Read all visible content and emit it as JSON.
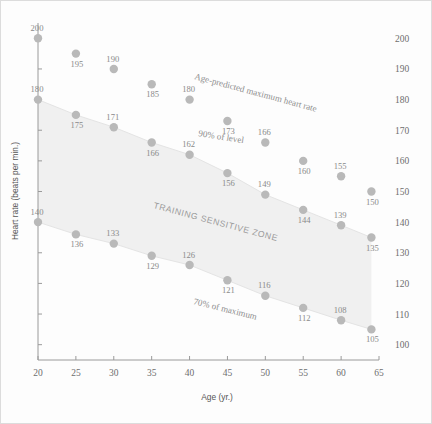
{
  "chart_data": {
    "type": "scatter",
    "title": "",
    "xlabel": "Age (yr.)",
    "ylabel": "Heart rate (beats per min.)",
    "xlim": [
      20,
      65
    ],
    "ylim": [
      95,
      205
    ],
    "xticks": [
      20,
      25,
      30,
      35,
      40,
      45,
      50,
      55,
      60,
      65
    ],
    "yticks": [
      100,
      110,
      120,
      130,
      140,
      150,
      160,
      170,
      180,
      190,
      200
    ],
    "grid": false,
    "legend_position": "inline-annotations",
    "x": [
      20,
      25,
      30,
      35,
      40,
      45,
      50,
      55,
      60,
      64
    ],
    "series": [
      {
        "name": "Age-predicted maximum heart rate",
        "values": [
          200,
          195,
          190,
          185,
          180,
          173,
          166,
          160,
          155,
          150
        ]
      },
      {
        "name": "90% of level",
        "values": [
          180,
          175,
          171,
          166,
          162,
          156,
          149,
          144,
          139,
          135
        ]
      },
      {
        "name": "70% of maximum",
        "values": [
          140,
          136,
          133,
          129,
          126,
          121,
          116,
          112,
          108,
          105
        ]
      }
    ],
    "annotations": [
      {
        "text": "Age-predicted maximum heart rate",
        "kind": "curve-label"
      },
      {
        "text": "90% of level",
        "kind": "curve-label"
      },
      {
        "text": "70% of maximum",
        "kind": "curve-label"
      },
      {
        "text": "TRAINING SENSITIVE ZONE",
        "kind": "zone-label"
      }
    ],
    "shaded_band": {
      "label": "TRAINING SENSITIVE ZONE",
      "upper_series": "90% of level",
      "lower_series": "70% of maximum",
      "color": "#f0f0f0"
    },
    "colors": {
      "marker": "#b9b9b9",
      "axis": "#9a9a9a",
      "text": "#8a8a8a",
      "band": "#f0f0f0",
      "background": "#fdfdfd"
    }
  }
}
